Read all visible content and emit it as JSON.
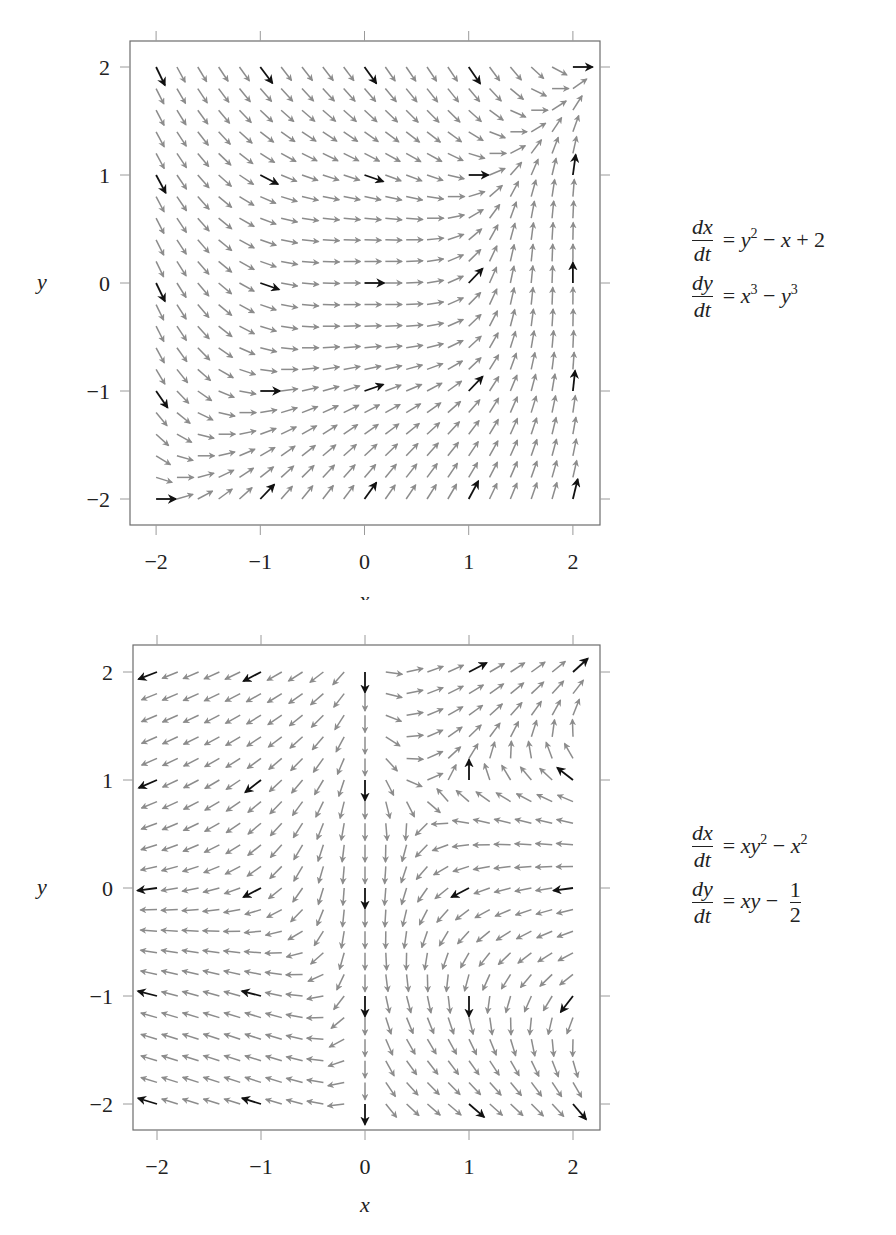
{
  "chart_data": [
    {
      "type": "quiver",
      "title": "",
      "xlabel": "x",
      "ylabel": "y",
      "xlim": [
        -2.25,
        2.25
      ],
      "ylim": [
        -2.25,
        2.25
      ],
      "xticks": [
        -2,
        -1,
        0,
        1,
        2
      ],
      "yticks": [
        -2,
        -1,
        0,
        1,
        2
      ],
      "xtick_labels": [
        "−2",
        "−1",
        "0",
        "1",
        "2"
      ],
      "ytick_labels": [
        "−2",
        "−1",
        "0",
        "1",
        "2"
      ],
      "grid": false,
      "grid_points": {
        "x_start": -2,
        "x_end": 2,
        "y_start": -2,
        "y_end": 2,
        "step": 0.2,
        "count_per_axis": 21
      },
      "highlight_every": 5,
      "arrow_color": "#8c8c8c",
      "highlight_color": "#111111",
      "system": {
        "dx_dt": "y^2 - x + 2",
        "dy_dt": "x^3 - y^3"
      },
      "equations": [
        {
          "lhs_num": "dx",
          "lhs_den": "dt",
          "rhs": "y² − x + 2"
        },
        {
          "lhs_num": "dy",
          "lhs_den": "dt",
          "rhs": "x³ − y³"
        }
      ]
    },
    {
      "type": "quiver",
      "title": "",
      "xlabel": "x",
      "ylabel": "y",
      "xlim": [
        -2.25,
        2.25
      ],
      "ylim": [
        -2.25,
        2.25
      ],
      "xticks": [
        -2,
        -1,
        0,
        1,
        2
      ],
      "yticks": [
        -2,
        -1,
        0,
        1,
        2
      ],
      "xtick_labels": [
        "−2",
        "−1",
        "0",
        "1",
        "2"
      ],
      "ytick_labels": [
        "−2",
        "−1",
        "0",
        "1",
        "2"
      ],
      "grid": false,
      "grid_points": {
        "x_start": -2,
        "x_end": 2,
        "y_start": -2,
        "y_end": 2,
        "step": 0.2,
        "count_per_axis": 21
      },
      "highlight_every": 5,
      "arrow_color": "#8c8c8c",
      "highlight_color": "#111111",
      "system": {
        "dx_dt": "x*y^2 - x^2",
        "dy_dt": "x*y - 1/2"
      },
      "equations": [
        {
          "lhs_num": "dx",
          "lhs_den": "dt",
          "rhs": "xy² − x²"
        },
        {
          "lhs_num": "dy",
          "lhs_den": "dt",
          "rhs": "xy − 1/2"
        }
      ]
    }
  ],
  "plots": {
    "top": {
      "axis_x": "x",
      "axis_y": "y",
      "eq1": {
        "num": "dx",
        "den": "dt",
        "rhs_html": "= <i>y</i><sup>2</sup> − <i>x</i> + 2"
      },
      "eq2": {
        "num": "dy",
        "den": "dt",
        "rhs_html": "= <i>x</i><sup>3</sup> − <i>y</i><sup>3</sup>"
      }
    },
    "bottom": {
      "axis_x": "x",
      "axis_y": "y",
      "eq1": {
        "num": "dx",
        "den": "dt",
        "rhs_html": "= <i>xy</i><sup>2</sup> − <i>x</i><sup>2</sup>"
      },
      "eq2": {
        "num": "dy",
        "den": "dt",
        "rhs_prefix": "= xy −",
        "frac_num": "1",
        "frac_den": "2"
      }
    }
  }
}
